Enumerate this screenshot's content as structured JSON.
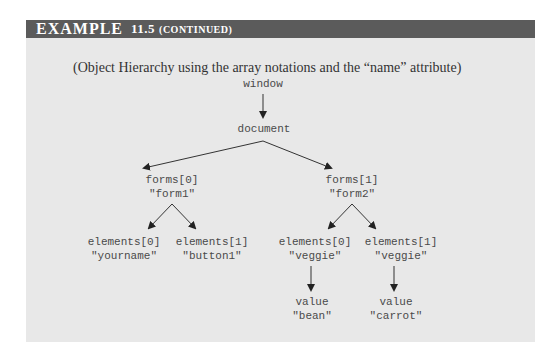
{
  "header": {
    "example_label": "EXAMPLE",
    "example_number": "11.5",
    "continued_label": "(continued)"
  },
  "caption": "(Object Hierarchy using the array notations and the “name” attribute)",
  "colors": {
    "header_bg": "#5b5b5b",
    "panel_bg": "#e8e8e8",
    "text": "#4a4a4a",
    "arrow": "#222222"
  },
  "tree": {
    "window": "window",
    "document": "document",
    "form0": {
      "index": "forms[0]",
      "name": "\"form1\""
    },
    "form1": {
      "index": "forms[1]",
      "name": "\"form2\""
    },
    "form0_el0": {
      "index": "elements[0]",
      "name": "\"yourname\""
    },
    "form0_el1": {
      "index": "elements[1]",
      "name": "\"button1\""
    },
    "form1_el0": {
      "index": "elements[0]",
      "name": "\"veggie\""
    },
    "form1_el1": {
      "index": "elements[1]",
      "name": "\"veggie\""
    },
    "value0": {
      "label": "value",
      "value": "\"bean\""
    },
    "value1": {
      "label": "value",
      "value": "\"carrot\""
    }
  }
}
